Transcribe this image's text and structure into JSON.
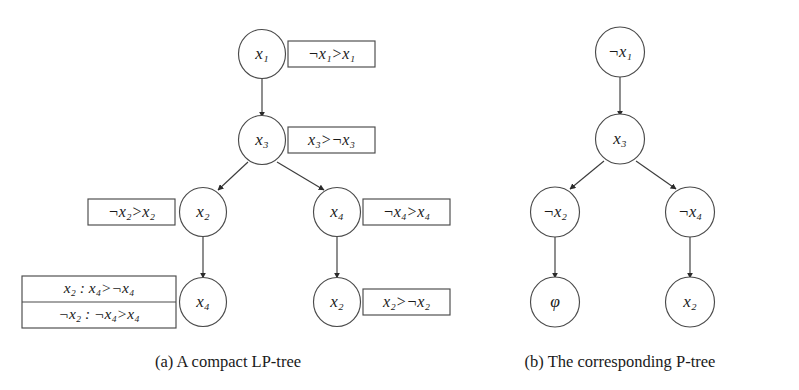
{
  "figure": {
    "panels": [
      {
        "id": "panel-a",
        "caption": "(a) A compact LP-tree",
        "nodes": [
          {
            "id": "a-n1",
            "label": "x₁",
            "var": "x",
            "sub": "1",
            "neg": false
          },
          {
            "id": "a-n2",
            "label": "x₃",
            "var": "x",
            "sub": "3",
            "neg": false
          },
          {
            "id": "a-n3",
            "label": "x₂",
            "var": "x",
            "sub": "2",
            "neg": false
          },
          {
            "id": "a-n4",
            "label": "x₄",
            "var": "x",
            "sub": "4",
            "neg": false
          },
          {
            "id": "a-n5",
            "label": "x₄",
            "var": "x",
            "sub": "4",
            "neg": false
          },
          {
            "id": "a-n6",
            "label": "x₂",
            "var": "x",
            "sub": "2",
            "neg": false
          }
        ],
        "edges": [
          {
            "from": "a-n1",
            "to": "a-n2"
          },
          {
            "from": "a-n2",
            "to": "a-n3"
          },
          {
            "from": "a-n2",
            "to": "a-n4"
          },
          {
            "from": "a-n3",
            "to": "a-n5"
          },
          {
            "from": "a-n4",
            "to": "a-n6"
          }
        ],
        "preference_tables": [
          {
            "id": "a-cpt1",
            "node": "a-n1",
            "side": "right",
            "rows": [
              "¬x₁>x₁"
            ]
          },
          {
            "id": "a-cpt2",
            "node": "a-n2",
            "side": "right",
            "rows": [
              "x₃>¬x₃"
            ]
          },
          {
            "id": "a-cpt3",
            "node": "a-n3",
            "side": "left",
            "rows": [
              "¬x₂>x₂"
            ]
          },
          {
            "id": "a-cpt4",
            "node": "a-n4",
            "side": "right",
            "rows": [
              "¬x₄>x₄"
            ]
          },
          {
            "id": "a-cpt5",
            "node": "a-n5",
            "side": "left",
            "rows": [
              "x₂ : x₄>¬x₄",
              "¬x₂ : ¬x₄>x₄"
            ]
          },
          {
            "id": "a-cpt6",
            "node": "a-n6",
            "side": "right",
            "rows": [
              "x₂>¬x₂"
            ]
          }
        ]
      },
      {
        "id": "panel-b",
        "caption": "(b) The corresponding P-tree",
        "nodes": [
          {
            "id": "b-n1",
            "label": "¬x₁",
            "var": "x",
            "sub": "1",
            "neg": true
          },
          {
            "id": "b-n2",
            "label": "x₃",
            "var": "x",
            "sub": "3",
            "neg": false
          },
          {
            "id": "b-n3",
            "label": "¬x₂",
            "var": "x",
            "sub": "2",
            "neg": true
          },
          {
            "id": "b-n4",
            "label": "¬x₄",
            "var": "x",
            "sub": "4",
            "neg": true
          },
          {
            "id": "b-n5",
            "label": "φ",
            "var": "φ",
            "sub": "",
            "neg": false
          },
          {
            "id": "b-n6",
            "label": "x₂",
            "var": "x",
            "sub": "2",
            "neg": false
          }
        ],
        "edges": [
          {
            "from": "b-n1",
            "to": "b-n2"
          },
          {
            "from": "b-n2",
            "to": "b-n3"
          },
          {
            "from": "b-n2",
            "to": "b-n4"
          },
          {
            "from": "b-n3",
            "to": "b-n5"
          },
          {
            "from": "b-n4",
            "to": "b-n6"
          }
        ],
        "preference_tables": []
      }
    ]
  },
  "glyphs": {
    "neg": "¬",
    "gt": ">",
    "colon": ":",
    "phi": "φ"
  },
  "colors": {
    "background": "#ffffff",
    "stroke": "#4a4a4a",
    "text": "#1a1a1a"
  }
}
